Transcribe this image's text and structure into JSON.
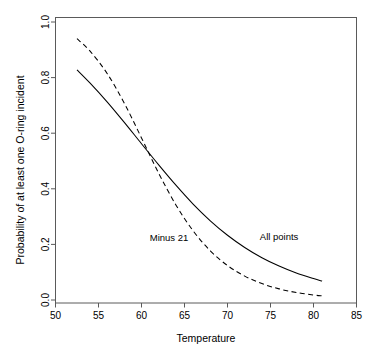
{
  "chart_data": {
    "type": "line",
    "title": "",
    "xlabel": "Temperature",
    "ylabel": "Probability of at least one O-ring incident",
    "xlim": [
      50,
      85
    ],
    "ylim": [
      0.0,
      1.0
    ],
    "grid": false,
    "legend_position": "inline-annotations",
    "xticks": [
      50,
      55,
      60,
      65,
      70,
      75,
      80,
      85
    ],
    "xtick_labels": [
      "50",
      "55",
      "60",
      "65",
      "70",
      "75",
      "80",
      "85"
    ],
    "yticks": [
      0.0,
      0.2,
      0.4,
      0.6,
      0.8,
      1.0
    ],
    "ytick_labels": [
      "0.0",
      "0.2",
      "0.4",
      "0.6",
      "0.8",
      "1.0"
    ],
    "series": [
      {
        "name": "All points",
        "style": "solid",
        "color": "#000000",
        "annotation": "All points",
        "annotation_x": 76.0,
        "annotation_y": 0.215,
        "x": [
          52.5,
          54,
          56,
          58,
          60,
          62,
          64,
          66,
          68,
          70,
          72,
          74,
          76,
          78,
          80,
          81
        ],
        "y": [
          0.828,
          0.781,
          0.713,
          0.639,
          0.562,
          0.486,
          0.413,
          0.345,
          0.285,
          0.233,
          0.189,
          0.152,
          0.122,
          0.097,
          0.077,
          0.068
        ]
      },
      {
        "name": "Minus 21",
        "style": "dashed",
        "color": "#000000",
        "annotation": "Minus 21",
        "annotation_x": 63.2,
        "annotation_y": 0.213,
        "x": [
          52.5,
          54,
          56,
          58,
          60,
          62,
          64,
          66,
          68,
          70,
          72,
          74,
          76,
          78,
          80,
          81
        ],
        "y": [
          0.94,
          0.896,
          0.815,
          0.708,
          0.583,
          0.456,
          0.342,
          0.249,
          0.177,
          0.124,
          0.086,
          0.059,
          0.04,
          0.027,
          0.018,
          0.015
        ]
      }
    ]
  }
}
